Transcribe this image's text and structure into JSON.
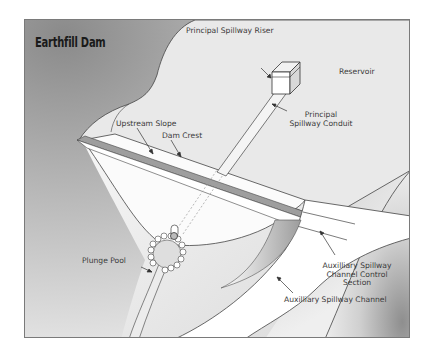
{
  "diagram": {
    "title": "Earthfill Dam",
    "colors": {
      "frame_border": "#7a7a7a",
      "reservoir": "#e9e9e9",
      "hill_dark": "#8c8c8c",
      "dam_face": "#fafafa",
      "crest": "#9a9a9a",
      "line": "#555555"
    },
    "labels": {
      "principal_riser": "Principal Spillway Riser",
      "reservoir": "Reservoir",
      "upstream_slope": "Upstream Slope",
      "dam_crest": "Dam Crest",
      "principal_conduit_1": "Principal",
      "principal_conduit_2": "Spillway Conduit",
      "plunge_pool": "Plunge Pool",
      "aux_control_1": "Auxilliary Spillway",
      "aux_control_2": "Channel Control",
      "aux_control_3": "Section",
      "aux_channel": "Auxilliary Spillway Channel"
    }
  }
}
